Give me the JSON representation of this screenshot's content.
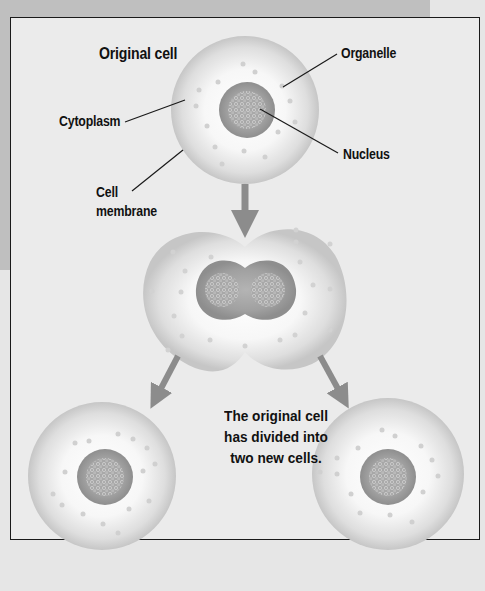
{
  "diagram": {
    "title": "Original cell",
    "labels": {
      "organelle": "Organelle",
      "cytoplasm": "Cytoplasm",
      "nucleus": "Nucleus",
      "cell_membrane_line1": "Cell",
      "cell_membrane_line2": "membrane"
    },
    "caption": {
      "line1": "The original cell",
      "line2": "has divided into",
      "line3": "two new cells."
    },
    "stages": [
      "original-cell",
      "dividing-cell",
      "daughter-cell-left",
      "daughter-cell-right"
    ],
    "colors": {
      "arrow": "#8c8c8c",
      "nucleus": "#9a9a9a",
      "cytoplasm": "#f2f2f2",
      "membrane_shade": "#c4c4c4",
      "frame": "#1a1a1a",
      "background": "#e6e6e6"
    }
  }
}
